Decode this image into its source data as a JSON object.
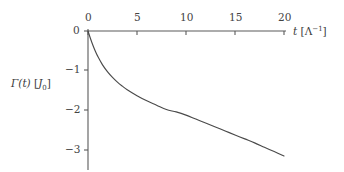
{
  "chart_data": {
    "type": "line",
    "title": "",
    "subtitle": "",
    "xlabel_var": "t",
    "xlabel_unit": "[Λ−1]",
    "xlabel": "t [Λ⁻¹]",
    "ylabel_var": "Γ(t)",
    "ylabel_unit": "[J0]",
    "ylabel": "Γ(t) [J₀]",
    "xlim": [
      0,
      20
    ],
    "ylim": [
      -3.3,
      0
    ],
    "xticks": [
      0,
      5,
      10,
      15,
      20
    ],
    "xtick_labels": [
      "0",
      "5",
      "10",
      "15",
      "20"
    ],
    "yticks": [
      0,
      -1,
      -2,
      -3
    ],
    "ytick_labels": [
      "0",
      "−1",
      "−2",
      "−3"
    ],
    "grid": false,
    "legend": "none",
    "x_axis_position": "top",
    "y_axis_position": "left",
    "series": [
      {
        "name": "Γ(t)",
        "color": "#4a4a4a",
        "x": [
          0,
          0.25,
          0.5,
          0.75,
          1,
          1.5,
          2,
          2.5,
          3,
          3.5,
          4,
          5,
          6,
          7,
          8,
          9,
          10,
          11,
          12,
          13,
          14,
          15,
          16,
          17,
          18,
          19,
          20
        ],
        "y": [
          0,
          -0.19,
          -0.36,
          -0.51,
          -0.64,
          -0.86,
          -1.03,
          -1.17,
          -1.29,
          -1.39,
          -1.48,
          -1.63,
          -1.76,
          -1.87,
          -1.98,
          -2.04,
          -2.12,
          -2.22,
          -2.32,
          -2.42,
          -2.52,
          -2.62,
          -2.72,
          -2.82,
          -2.93,
          -3.04,
          -3.15
        ]
      }
    ],
    "annotations": []
  },
  "style": {
    "axis_color": "#5a5a5a",
    "curve_color": "#4a4a4a",
    "background": "#ffffff",
    "text_color": "#3a3a3a"
  }
}
